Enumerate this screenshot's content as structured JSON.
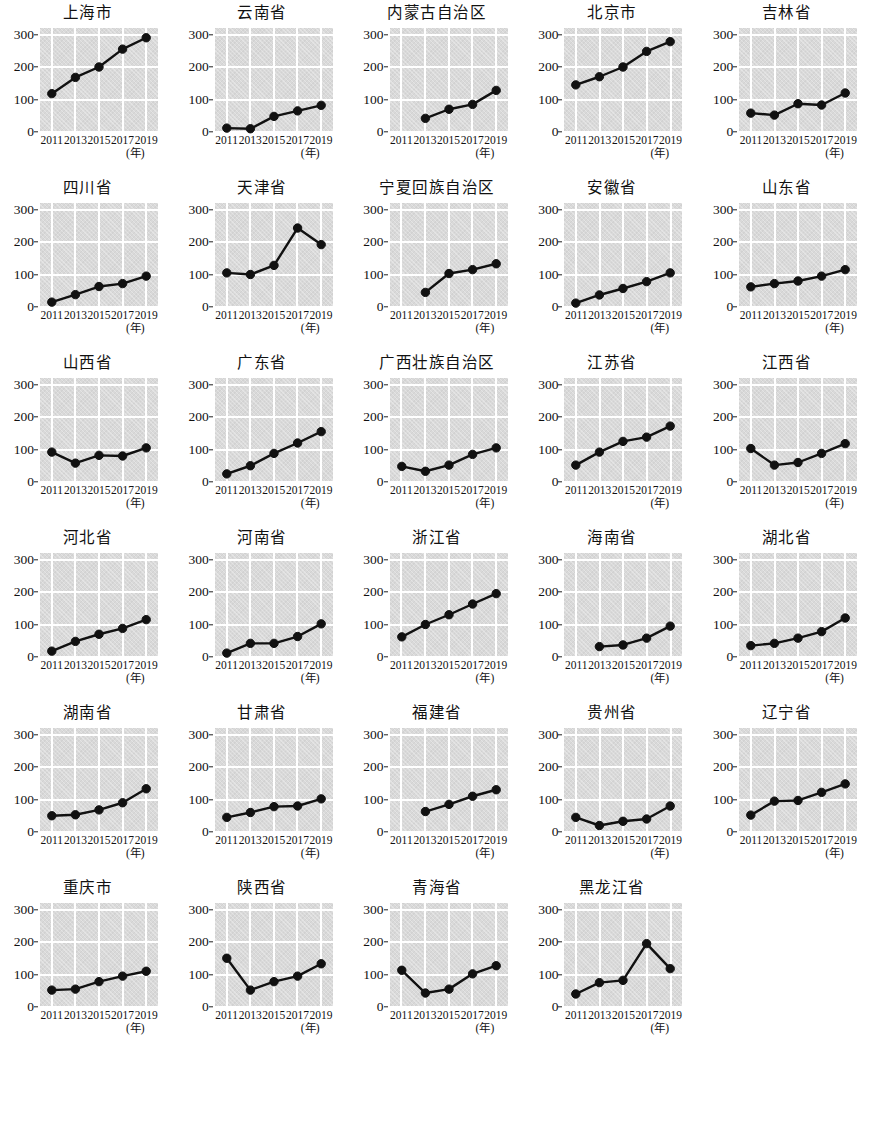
{
  "figure": {
    "x_unit_label": "(年)",
    "x_tick_labels": [
      "2011",
      "2013",
      "2015",
      "2017",
      "2019"
    ],
    "y_tick_labels": [
      "0",
      "100",
      "200",
      "300"
    ],
    "colors": {
      "panel_background": "#d9d9d9",
      "gridline": "#ffffff",
      "line": "#111111",
      "marker": "#111111",
      "text": "#111111"
    }
  },
  "chart_data": [
    {
      "type": "line",
      "title": "上海市",
      "x": [
        2011,
        2013,
        2015,
        2017,
        2019
      ],
      "values": [
        118,
        168,
        200,
        255,
        290
      ],
      "xlabel": "(年)",
      "ylabel": "",
      "ylim": [
        0,
        320
      ],
      "yticks": [
        0,
        100,
        200,
        300
      ],
      "grid": true,
      "legend": "none"
    },
    {
      "type": "line",
      "title": "云南省",
      "x": [
        2011,
        2013,
        2015,
        2017,
        2019
      ],
      "values": [
        12,
        10,
        48,
        65,
        82
      ],
      "xlabel": "(年)",
      "ylabel": "",
      "ylim": [
        0,
        320
      ],
      "yticks": [
        0,
        100,
        200,
        300
      ],
      "grid": true,
      "legend": "none"
    },
    {
      "type": "line",
      "title": "内蒙古自治区",
      "x": [
        2011,
        2013,
        2015,
        2017,
        2019
      ],
      "values": [
        null,
        42,
        70,
        85,
        128
      ],
      "xlabel": "(年)",
      "ylabel": "",
      "ylim": [
        0,
        320
      ],
      "yticks": [
        0,
        100,
        200,
        300
      ],
      "grid": true,
      "legend": "none"
    },
    {
      "type": "line",
      "title": "北京市",
      "x": [
        2011,
        2013,
        2015,
        2017,
        2019
      ],
      "values": [
        145,
        170,
        200,
        248,
        278
      ],
      "xlabel": "(年)",
      "ylabel": "",
      "ylim": [
        0,
        320
      ],
      "yticks": [
        0,
        100,
        200,
        300
      ],
      "grid": true,
      "legend": "none"
    },
    {
      "type": "line",
      "title": "吉林省",
      "x": [
        2011,
        2013,
        2015,
        2017,
        2019
      ],
      "values": [
        58,
        52,
        87,
        83,
        120
      ],
      "xlabel": "(年)",
      "ylabel": "",
      "ylim": [
        0,
        320
      ],
      "yticks": [
        0,
        100,
        200,
        300
      ],
      "grid": true,
      "legend": "none"
    },
    {
      "type": "line",
      "title": "四川省",
      "x": [
        2011,
        2013,
        2015,
        2017,
        2019
      ],
      "values": [
        15,
        38,
        63,
        72,
        95
      ],
      "xlabel": "(年)",
      "ylabel": "",
      "ylim": [
        0,
        320
      ],
      "yticks": [
        0,
        100,
        200,
        300
      ],
      "grid": true,
      "legend": "none"
    },
    {
      "type": "line",
      "title": "天津省",
      "x": [
        2011,
        2013,
        2015,
        2017,
        2019
      ],
      "values": [
        105,
        100,
        128,
        243,
        192
      ],
      "xlabel": "(年)",
      "ylabel": "",
      "ylim": [
        0,
        320
      ],
      "yticks": [
        0,
        100,
        200,
        300
      ],
      "grid": true,
      "legend": "none"
    },
    {
      "type": "line",
      "title": "宁夏回族自治区",
      "x": [
        2011,
        2013,
        2015,
        2017,
        2019
      ],
      "values": [
        null,
        45,
        103,
        115,
        133
      ],
      "xlabel": "(年)",
      "ylabel": "",
      "ylim": [
        0,
        320
      ],
      "yticks": [
        0,
        100,
        200,
        300
      ],
      "grid": true,
      "legend": "none"
    },
    {
      "type": "line",
      "title": "安徽省",
      "x": [
        2011,
        2013,
        2015,
        2017,
        2019
      ],
      "values": [
        12,
        37,
        57,
        78,
        105
      ],
      "xlabel": "(年)",
      "ylabel": "",
      "ylim": [
        0,
        320
      ],
      "yticks": [
        0,
        100,
        200,
        300
      ],
      "grid": true,
      "legend": "none"
    },
    {
      "type": "line",
      "title": "山东省",
      "x": [
        2011,
        2013,
        2015,
        2017,
        2019
      ],
      "values": [
        62,
        72,
        80,
        95,
        115
      ],
      "xlabel": "(年)",
      "ylabel": "",
      "ylim": [
        0,
        320
      ],
      "yticks": [
        0,
        100,
        200,
        300
      ],
      "grid": true,
      "legend": "none"
    },
    {
      "type": "line",
      "title": "山西省",
      "x": [
        2011,
        2013,
        2015,
        2017,
        2019
      ],
      "values": [
        92,
        58,
        82,
        80,
        105
      ],
      "xlabel": "(年)",
      "ylabel": "",
      "ylim": [
        0,
        320
      ],
      "yticks": [
        0,
        100,
        200,
        300
      ],
      "grid": true,
      "legend": "none"
    },
    {
      "type": "line",
      "title": "广东省",
      "x": [
        2011,
        2013,
        2015,
        2017,
        2019
      ],
      "values": [
        25,
        50,
        88,
        120,
        155
      ],
      "xlabel": "(年)",
      "ylabel": "",
      "ylim": [
        0,
        320
      ],
      "yticks": [
        0,
        100,
        200,
        300
      ],
      "grid": true,
      "legend": "none"
    },
    {
      "type": "line",
      "title": "广西壮族自治区",
      "x": [
        2011,
        2013,
        2015,
        2017,
        2019
      ],
      "values": [
        48,
        33,
        52,
        85,
        105
      ],
      "xlabel": "(年)",
      "ylabel": "",
      "ylim": [
        0,
        320
      ],
      "yticks": [
        0,
        100,
        200,
        300
      ],
      "grid": true,
      "legend": "none"
    },
    {
      "type": "line",
      "title": "江苏省",
      "x": [
        2011,
        2013,
        2015,
        2017,
        2019
      ],
      "values": [
        52,
        92,
        125,
        138,
        172
      ],
      "xlabel": "(年)",
      "ylabel": "",
      "ylim": [
        0,
        320
      ],
      "yticks": [
        0,
        100,
        200,
        300
      ],
      "grid": true,
      "legend": "none"
    },
    {
      "type": "line",
      "title": "江西省",
      "x": [
        2011,
        2013,
        2015,
        2017,
        2019
      ],
      "values": [
        103,
        52,
        60,
        88,
        118
      ],
      "xlabel": "(年)",
      "ylabel": "",
      "ylim": [
        0,
        320
      ],
      "yticks": [
        0,
        100,
        200,
        300
      ],
      "grid": true,
      "legend": "none"
    },
    {
      "type": "line",
      "title": "河北省",
      "x": [
        2011,
        2013,
        2015,
        2017,
        2019
      ],
      "values": [
        18,
        48,
        70,
        88,
        115
      ],
      "xlabel": "(年)",
      "ylabel": "",
      "ylim": [
        0,
        320
      ],
      "yticks": [
        0,
        100,
        200,
        300
      ],
      "grid": true,
      "legend": "none"
    },
    {
      "type": "line",
      "title": "河南省",
      "x": [
        2011,
        2013,
        2015,
        2017,
        2019
      ],
      "values": [
        12,
        42,
        42,
        63,
        102
      ],
      "xlabel": "(年)",
      "ylabel": "",
      "ylim": [
        0,
        320
      ],
      "yticks": [
        0,
        100,
        200,
        300
      ],
      "grid": true,
      "legend": "none"
    },
    {
      "type": "line",
      "title": "浙江省",
      "x": [
        2011,
        2013,
        2015,
        2017,
        2019
      ],
      "values": [
        62,
        100,
        130,
        163,
        195
      ],
      "xlabel": "(年)",
      "ylabel": "",
      "ylim": [
        0,
        320
      ],
      "yticks": [
        0,
        100,
        200,
        300
      ],
      "grid": true,
      "legend": "none"
    },
    {
      "type": "line",
      "title": "海南省",
      "x": [
        2011,
        2013,
        2015,
        2017,
        2019
      ],
      "values": [
        null,
        32,
        37,
        58,
        95
      ],
      "xlabel": "(年)",
      "ylabel": "",
      "ylim": [
        0,
        320
      ],
      "yticks": [
        0,
        100,
        200,
        300
      ],
      "grid": true,
      "legend": "none"
    },
    {
      "type": "line",
      "title": "湖北省",
      "x": [
        2011,
        2013,
        2015,
        2017,
        2019
      ],
      "values": [
        35,
        42,
        58,
        78,
        120
      ],
      "xlabel": "(年)",
      "ylabel": "",
      "ylim": [
        0,
        320
      ],
      "yticks": [
        0,
        100,
        200,
        300
      ],
      "grid": true,
      "legend": "none"
    },
    {
      "type": "line",
      "title": "湖南省",
      "x": [
        2011,
        2013,
        2015,
        2017,
        2019
      ],
      "values": [
        50,
        53,
        68,
        90,
        133
      ],
      "xlabel": "(年)",
      "ylabel": "",
      "ylim": [
        0,
        320
      ],
      "yticks": [
        0,
        100,
        200,
        300
      ],
      "grid": true,
      "legend": "none"
    },
    {
      "type": "line",
      "title": "甘肃省",
      "x": [
        2011,
        2013,
        2015,
        2017,
        2019
      ],
      "values": [
        45,
        60,
        78,
        80,
        102
      ],
      "xlabel": "(年)",
      "ylabel": "",
      "ylim": [
        0,
        320
      ],
      "yticks": [
        0,
        100,
        200,
        300
      ],
      "grid": true,
      "legend": "none"
    },
    {
      "type": "line",
      "title": "福建省",
      "x": [
        2011,
        2013,
        2015,
        2017,
        2019
      ],
      "values": [
        null,
        63,
        85,
        110,
        130
      ],
      "xlabel": "(年)",
      "ylabel": "",
      "ylim": [
        0,
        320
      ],
      "yticks": [
        0,
        100,
        200,
        300
      ],
      "grid": true,
      "legend": "none"
    },
    {
      "type": "line",
      "title": "贵州省",
      "x": [
        2011,
        2013,
        2015,
        2017,
        2019
      ],
      "values": [
        45,
        20,
        33,
        40,
        80
      ],
      "xlabel": "(年)",
      "ylabel": "",
      "ylim": [
        0,
        320
      ],
      "yticks": [
        0,
        100,
        200,
        300
      ],
      "grid": true,
      "legend": "none"
    },
    {
      "type": "line",
      "title": "辽宁省",
      "x": [
        2011,
        2013,
        2015,
        2017,
        2019
      ],
      "values": [
        52,
        95,
        97,
        122,
        148
      ],
      "xlabel": "(年)",
      "ylabel": "",
      "ylim": [
        0,
        320
      ],
      "yticks": [
        0,
        100,
        200,
        300
      ],
      "grid": true,
      "legend": "none"
    },
    {
      "type": "line",
      "title": "重庆市",
      "x": [
        2011,
        2013,
        2015,
        2017,
        2019
      ],
      "values": [
        52,
        55,
        78,
        95,
        110
      ],
      "xlabel": "(年)",
      "ylabel": "",
      "ylim": [
        0,
        320
      ],
      "yticks": [
        0,
        100,
        200,
        300
      ],
      "grid": true,
      "legend": "none"
    },
    {
      "type": "line",
      "title": "陕西省",
      "x": [
        2011,
        2013,
        2015,
        2017,
        2019
      ],
      "values": [
        150,
        52,
        78,
        95,
        133
      ],
      "xlabel": "(年)",
      "ylabel": "",
      "ylim": [
        0,
        320
      ],
      "yticks": [
        0,
        100,
        200,
        300
      ],
      "grid": true,
      "legend": "none"
    },
    {
      "type": "line",
      "title": "青海省",
      "x": [
        2011,
        2013,
        2015,
        2017,
        2019
      ],
      "values": [
        113,
        43,
        55,
        102,
        127
      ],
      "xlabel": "(年)",
      "ylabel": "",
      "ylim": [
        0,
        320
      ],
      "yticks": [
        0,
        100,
        200,
        300
      ],
      "grid": true,
      "legend": "none"
    },
    {
      "type": "line",
      "title": "黑龙江省",
      "x": [
        2011,
        2013,
        2015,
        2017,
        2019
      ],
      "values": [
        40,
        75,
        82,
        195,
        118
      ],
      "xlabel": "(年)",
      "ylabel": "",
      "ylim": [
        0,
        320
      ],
      "yticks": [
        0,
        100,
        200,
        300
      ],
      "grid": true,
      "legend": "none"
    }
  ]
}
